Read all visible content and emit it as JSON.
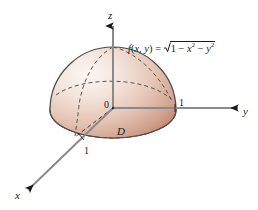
{
  "figure": {
    "background_color": "#ffffff"
  },
  "axes": {
    "z_label": "z",
    "y_label": "y",
    "x_label": "x",
    "origin_label": "0",
    "y_unit_label": "1",
    "x_unit_label": "1",
    "axis_color": "#7a7a7a",
    "arrow_color": "#1a1a1a"
  },
  "region": {
    "domain_label": "D"
  },
  "formula": {
    "fn_name": "f",
    "open_paren": "(",
    "var_x": "x",
    "comma": ", ",
    "var_y": "y",
    "close_paren": ")",
    "equals": " = ",
    "radicand_one": "1",
    "minus_first": " − ",
    "rad_var_x": "x",
    "exp_x": "2",
    "minus_second": " − ",
    "rad_var_y": "y",
    "exp_y": "2",
    "full_text": "f(x, y) = √(1 − x² − y²)"
  },
  "surface": {
    "fill_light": "#f6ece7",
    "fill_mid": "#e6c6b6",
    "fill_dark": "#c08b79",
    "outline_color": "#4a4a4a",
    "gridline_color": "#555555"
  }
}
